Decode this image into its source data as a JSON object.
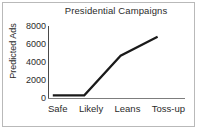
{
  "figure": {
    "title": "Presidential Campaigns",
    "background_color": "#ffffff",
    "frame_color": "#b9b9b9",
    "text_color": "#2b2b2b"
  },
  "chart_data": {
    "type": "line",
    "title": "Presidential Campaigns",
    "xlabel": "",
    "ylabel": "Predicted Ads",
    "categories": [
      "Safe",
      "Likely",
      "Leans",
      "Toss-up"
    ],
    "values": [
      300,
      300,
      4700,
      6800
    ],
    "series": [
      {
        "name": "Predicted Ads",
        "values": [
          300,
          300,
          4700,
          6800
        ],
        "color": "#1a1a1a",
        "line_width": 2.2,
        "markers": false
      }
    ],
    "ylim": [
      0,
      8000
    ],
    "yticks": [
      0,
      2000,
      4000,
      6000,
      8000
    ],
    "ytick_labels": [
      "0",
      "2000",
      "4000",
      "6000",
      "8000"
    ],
    "xtick_labels": [
      "Safe",
      "Likely",
      "Leans",
      "Toss-up"
    ],
    "grid": false,
    "legend": false,
    "legend_position": "none",
    "axis_color": "#4a4a4a",
    "xaxis_color": "#7d7d7d"
  }
}
